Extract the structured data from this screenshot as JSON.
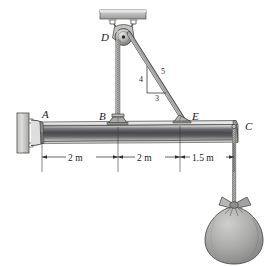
{
  "figure": {
    "background_color": "#ffffff"
  },
  "points": {
    "a": "A",
    "b": "B",
    "c": "C",
    "d": "D",
    "e": "E"
  },
  "dimensions": [
    {
      "id": "ab",
      "label": "2 m"
    },
    {
      "id": "be",
      "label": "2 m"
    },
    {
      "id": "ec",
      "label": "1.5 m"
    }
  ],
  "slope_triangle": {
    "vertical": "4",
    "hypotenuse": "5",
    "horizontal": "3"
  },
  "components": {
    "ceiling_plate": "ceiling-mount-plate",
    "pulley": "pulley-at-d",
    "beam": "horizontal-beam",
    "wall_support": "pin-support-at-wall",
    "sack": "suspended-sack",
    "cable_db": "vertical-cable-d-to-b",
    "cable_de": "inclined-cable-d-to-e",
    "rope_c": "rope-c-to-sack"
  },
  "colors": {
    "beam_light": "#e8e8e6",
    "beam_mid": "#56565a",
    "beam_dark": "#3a3a3e",
    "metal_light": "#d8d8d6",
    "metal_mid": "#a8a8a6",
    "metal_dark": "#6a6a68",
    "outline": "#3c3c3c",
    "sack_fill": "#a9a9a7",
    "rope": "#8e8e8c",
    "text": "#1a1a1a"
  }
}
